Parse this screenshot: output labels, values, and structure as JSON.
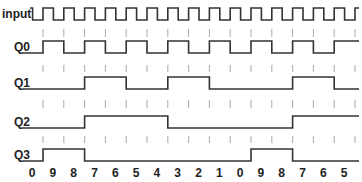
{
  "signals": [
    {
      "label": "input",
      "y_high": 8,
      "y_low": 20,
      "type": "clock"
    },
    {
      "label": "Q0",
      "y_high": 41,
      "y_low": 53,
      "bit": 0
    },
    {
      "label": "Q1",
      "y_high": 77,
      "y_low": 89,
      "bit": 1
    },
    {
      "label": "Q2",
      "y_high": 116,
      "y_low": 128,
      "bit": 2
    },
    {
      "label": "Q3",
      "y_high": 149,
      "y_low": 161,
      "bit": 3
    }
  ],
  "sequence": [
    "0",
    "9",
    "8",
    "7",
    "6",
    "5",
    "4",
    "3",
    "2",
    "1",
    "0",
    "9",
    "8",
    "7",
    "6",
    "5"
  ],
  "layout": {
    "x_start": 22,
    "first_edge": 43,
    "period": 20.8,
    "x_end": 359,
    "tick_rows": [
      [
        29,
        37
      ],
      [
        65,
        72
      ],
      [
        100,
        108
      ],
      [
        136,
        143
      ]
    ],
    "digit_y": 177
  },
  "colors": {
    "wave": "#333333",
    "tick": "#aaaaaa",
    "text": "#222222"
  }
}
